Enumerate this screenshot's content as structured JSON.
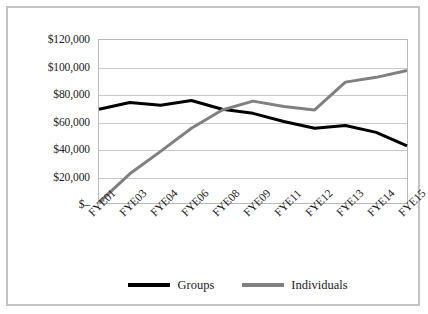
{
  "chart_data": {
    "type": "line",
    "title": "",
    "xlabel": "",
    "ylabel": "",
    "categories": [
      "FYE01",
      "FYE03",
      "FYE04",
      "FYE06",
      "FYE08",
      "FYE09",
      "FYE11",
      "FYE12",
      "FYE13",
      "FYE14",
      "FYE15"
    ],
    "series": [
      {
        "name": "Groups",
        "color": "#000000",
        "values": [
          69000,
          74000,
          72000,
          75500,
          69000,
          66000,
          60000,
          55000,
          57000,
          52000,
          42000
        ]
      },
      {
        "name": "Individuals",
        "color": "#808080",
        "values": [
          500,
          21500,
          38000,
          55000,
          68500,
          75000,
          71000,
          68500,
          89000,
          92500,
          97500
        ]
      }
    ],
    "ylim": [
      0,
      120000
    ],
    "yticks": [
      0,
      20000,
      40000,
      60000,
      80000,
      100000,
      120000
    ],
    "ytick_labels": [
      "$–",
      "$20,000",
      "$40,000",
      "$60,000",
      "$80,000",
      "$100,000",
      "$120,000"
    ],
    "grid": true,
    "legend_position": "bottom",
    "frame_color": "#c3c3c3",
    "gridline_color": "#c9c9c9",
    "plot_border_color": "#b9b9b9"
  },
  "legend": {
    "entries": [
      {
        "label": "Groups",
        "color": "#000000"
      },
      {
        "label": "Individuals",
        "color": "#808080"
      }
    ]
  }
}
